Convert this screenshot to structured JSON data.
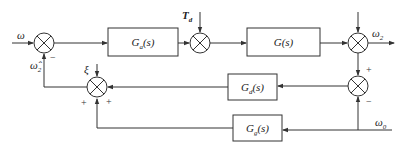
{
  "diagram": {
    "type": "control-block-diagram",
    "blocks": [
      {
        "id": "Ga",
        "label": "Gₐ(s)"
      },
      {
        "id": "G",
        "label": "G(s)"
      },
      {
        "id": "Gd",
        "label": "G_d(s)"
      },
      {
        "id": "Gg",
        "label": "G_g(s)"
      }
    ],
    "block_labels": {
      "ga": "Ga(s)",
      "g": "G(s)",
      "gd": "Gd(s)",
      "gg": "Gg(s)"
    },
    "signals": {
      "input": "ω",
      "disturbance_torque": "T",
      "disturbance_torque_sub": "d",
      "output": "ω",
      "output_sub": "2",
      "estimate": "ω̂",
      "estimate_sub": "2",
      "noise": "ξ",
      "base": "ω",
      "base_sub": "0"
    },
    "signs": {
      "s1_feedback": "−",
      "s4_top": "+",
      "s4_bottom": "−",
      "s5_left": "+",
      "s5_right": "+"
    },
    "colors": {
      "line": "#333333",
      "background": "#ffffff"
    }
  }
}
